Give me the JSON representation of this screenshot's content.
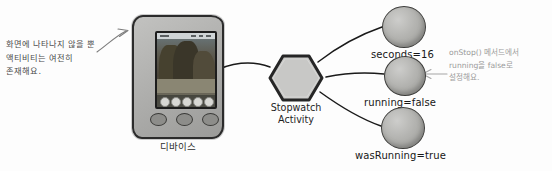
{
  "diagram": {
    "background_color": "#fdfdfd"
  },
  "left_annotation": {
    "name": "activity-still-exists-note",
    "lines": [
      "화면에 나타나지 않을 뿐",
      "액티비티는 여전히",
      "존재해요."
    ],
    "color": "#4a4a4a",
    "arrow": "curved-arrow-to-device"
  },
  "device": {
    "label": "디바이스",
    "screen": {
      "wallpaper": "mountain-landscape",
      "dock_app_count": 5
    },
    "hardware_button_count": 3
  },
  "activity": {
    "shape": "hexagon",
    "label_lines": [
      "Stopwatch",
      "Activity"
    ],
    "fill_color": "#c8c8c6",
    "stroke_color": "#262626"
  },
  "state_nodes": [
    {
      "id": "seconds",
      "label": "seconds=16",
      "fill_color": "#b4b4b1"
    },
    {
      "id": "running",
      "label": "running=false",
      "fill_color": "#b4b4b1"
    },
    {
      "id": "wasRunning",
      "label": "wasRunning=true",
      "fill_color": "#b4b4b1"
    }
  ],
  "right_annotation": {
    "name": "onstop-sets-running-false-note",
    "lines": [
      "onStop() 메서드에서",
      "running을 false로",
      "설정해요."
    ],
    "color": "#9b9b9b",
    "arrow": "left-arrow-to-running-node"
  }
}
